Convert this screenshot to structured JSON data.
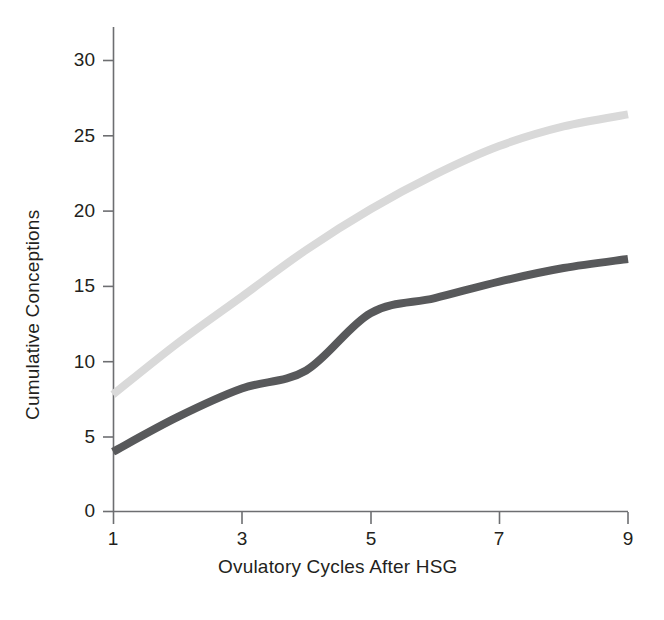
{
  "chart_data": {
    "type": "line",
    "title": "",
    "subtitle": "",
    "xlabel": "Ovulatory Cycles After HSG",
    "ylabel": "Cumulative Conceptions",
    "grid": false,
    "legend_position": "none",
    "xlim": [
      1,
      9
    ],
    "ylim": [
      0,
      31
    ],
    "x_ticks": [
      "1",
      "3",
      "5",
      "7",
      "9"
    ],
    "x_tick_values": [
      1,
      3,
      5,
      7,
      9
    ],
    "y_ticks": [
      "0",
      "5",
      "10",
      "15",
      "20",
      "25",
      "30"
    ],
    "y_tick_values": [
      0,
      5,
      10,
      15,
      20,
      25,
      30
    ],
    "x": [
      1,
      2,
      3,
      4,
      5,
      6,
      7,
      8,
      9
    ],
    "series": [
      {
        "name": "light-curve",
        "color": "#d9d9d9",
        "line_width": 8,
        "values": [
          7.8,
          11.2,
          14.3,
          17.4,
          20.1,
          22.4,
          24.3,
          25.6,
          26.4
        ]
      },
      {
        "name": "dark-curve",
        "color": "#58595b",
        "line_width": 8,
        "values": [
          4.0,
          6.3,
          8.2,
          9.4,
          13.2,
          14.2,
          15.3,
          16.2,
          16.8
        ]
      }
    ],
    "annotations": []
  },
  "colors": {
    "axis": "#6d6e71",
    "text": "#231f20",
    "background": "#ffffff",
    "series_light": "#d9d9d9",
    "series_dark": "#58595b"
  },
  "geometry": {
    "plot_left": 113,
    "plot_right": 628,
    "plot_top": 27,
    "plot_bottom": 512,
    "px_per_unit_y": 15.06,
    "px_per_cycle_x": 64.4
  }
}
